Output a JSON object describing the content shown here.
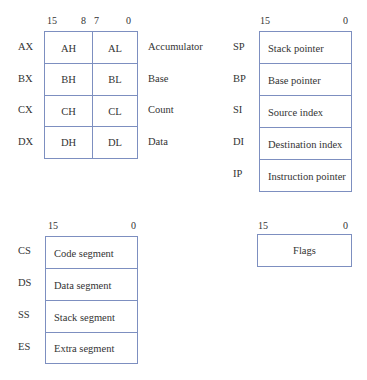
{
  "general_purpose": {
    "bits": {
      "b15": "15",
      "b8": "8",
      "b7": "7",
      "b0": "0"
    },
    "registers": [
      {
        "name": "AX",
        "high": "AH",
        "low": "AL",
        "description": "Accumulator"
      },
      {
        "name": "BX",
        "high": "BH",
        "low": "BL",
        "description": "Base"
      },
      {
        "name": "CX",
        "high": "CH",
        "low": "CL",
        "description": "Count"
      },
      {
        "name": "DX",
        "high": "DH",
        "low": "DL",
        "description": "Data"
      }
    ]
  },
  "pointer_index": {
    "bits": {
      "b15": "15",
      "b0": "0"
    },
    "registers": [
      {
        "name": "SP",
        "description": "Stack pointer"
      },
      {
        "name": "BP",
        "description": "Base pointer"
      },
      {
        "name": "SI",
        "description": "Source index"
      },
      {
        "name": "DI",
        "description": "Destination index"
      },
      {
        "name": "IP",
        "description": "Instruction pointer"
      }
    ]
  },
  "segment": {
    "bits": {
      "b15": "15",
      "b0": "0"
    },
    "registers": [
      {
        "name": "CS",
        "description": "Code segment"
      },
      {
        "name": "DS",
        "description": "Data segment"
      },
      {
        "name": "SS",
        "description": "Stack segment"
      },
      {
        "name": "ES",
        "description": "Extra segment"
      }
    ]
  },
  "flags": {
    "bits": {
      "b15": "15",
      "b0": "0"
    },
    "label": "Flags"
  },
  "colors": {
    "border": "#7d8fc0",
    "text": "#333333"
  }
}
